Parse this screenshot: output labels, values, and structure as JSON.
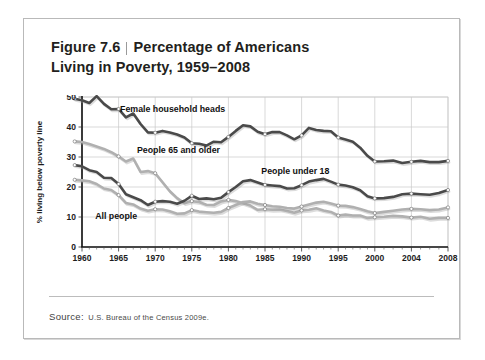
{
  "figure": {
    "number_label": "Figure 7.6",
    "title_line1": "Percentage of Americans",
    "title_line2": "Living in Poverty, 1959–2008"
  },
  "source": {
    "label": "Source:",
    "text": "U.S. Bureau of the Census 2009e."
  },
  "colors": {
    "dark_series": "#4a4a4a",
    "light_series": "#b0b0b0",
    "grid": "#c9c9c9",
    "axis": "#111111",
    "card_border": "#b9b9b9",
    "background": "#ffffff"
  },
  "chart_data": {
    "type": "line",
    "title": "Percentage of Americans Living in Poverty, 1959–2008",
    "xlabel": "",
    "ylabel": "% living below poverty line",
    "xlim": [
      1959,
      2008
    ],
    "ylim": [
      0,
      50
    ],
    "yticks": [
      0,
      10,
      20,
      30,
      40,
      50
    ],
    "xticks": [
      1960,
      1965,
      1970,
      1975,
      1980,
      1985,
      1990,
      1995,
      2000,
      2004,
      2008
    ],
    "grid": true,
    "legend": "inline-labels",
    "series": [
      {
        "name": "Female household heads",
        "color": "#4a4a4a",
        "label_x": 1965.2,
        "label_y": 45.0,
        "x": [
          1959,
          1960,
          1961,
          1962,
          1963,
          1964,
          1965,
          1966,
          1967,
          1968,
          1969,
          1970,
          1971,
          1972,
          1973,
          1974,
          1975,
          1976,
          1977,
          1978,
          1979,
          1980,
          1981,
          1982,
          1983,
          1984,
          1985,
          1986,
          1987,
          1988,
          1989,
          1990,
          1991,
          1992,
          1993,
          1994,
          1995,
          1996,
          1997,
          1998,
          1999,
          2000,
          2001,
          2002,
          2003,
          2004,
          2005,
          2006,
          2007,
          2008
        ],
        "y": [
          49.4,
          48.9,
          48.0,
          50.3,
          47.7,
          45.9,
          46.0,
          43.2,
          44.5,
          41.0,
          38.2,
          38.1,
          38.7,
          38.2,
          37.5,
          36.5,
          34.6,
          34.4,
          33.8,
          35.1,
          34.9,
          36.7,
          38.7,
          40.6,
          40.2,
          38.4,
          37.6,
          38.3,
          38.3,
          37.2,
          35.9,
          37.2,
          39.7,
          39.0,
          38.7,
          38.6,
          36.5,
          35.8,
          35.1,
          33.1,
          30.4,
          28.5,
          28.6,
          28.8,
          28.0,
          28.4,
          28.7,
          28.3,
          28.3,
          28.7
        ]
      },
      {
        "name": "People 65 and older",
        "color": "#b0b0b0",
        "label_x": 1967.5,
        "label_y": 31.3,
        "x": [
          1959,
          1960,
          1961,
          1962,
          1963,
          1964,
          1965,
          1966,
          1967,
          1968,
          1969,
          1970,
          1971,
          1972,
          1973,
          1974,
          1975,
          1976,
          1977,
          1978,
          1979,
          1980,
          1981,
          1982,
          1983,
          1984,
          1985,
          1986,
          1987,
          1988,
          1989,
          1990,
          1991,
          1992,
          1993,
          1994,
          1995,
          1996,
          1997,
          1998,
          1999,
          2000,
          2001,
          2002,
          2003,
          2004,
          2005,
          2006,
          2007,
          2008
        ],
        "y": [
          35.2,
          35.0,
          34.3,
          33.5,
          32.7,
          31.6,
          30.2,
          28.5,
          29.5,
          25.0,
          25.3,
          24.6,
          21.6,
          18.6,
          16.3,
          14.6,
          15.3,
          15.0,
          14.1,
          14.0,
          15.2,
          15.7,
          15.3,
          14.6,
          13.8,
          12.4,
          12.6,
          12.4,
          12.5,
          12.0,
          11.4,
          12.2,
          12.4,
          12.9,
          12.2,
          11.7,
          10.5,
          10.8,
          10.5,
          10.5,
          9.7,
          9.9,
          10.1,
          10.4,
          10.2,
          9.8,
          10.1,
          9.4,
          9.7,
          9.7
        ]
      },
      {
        "name": "People under 18",
        "color": "#4a4a4a",
        "label_x": 1984.5,
        "label_y": 24.3,
        "x": [
          1959,
          1960,
          1961,
          1962,
          1963,
          1964,
          1965,
          1966,
          1967,
          1968,
          1969,
          1970,
          1971,
          1972,
          1973,
          1974,
          1975,
          1976,
          1977,
          1978,
          1979,
          1980,
          1981,
          1982,
          1983,
          1984,
          1985,
          1986,
          1987,
          1988,
          1989,
          1990,
          1991,
          1992,
          1993,
          1994,
          1995,
          1996,
          1997,
          1998,
          1999,
          2000,
          2001,
          2002,
          2003,
          2004,
          2005,
          2006,
          2007,
          2008
        ],
        "y": [
          27.3,
          26.9,
          25.6,
          25.0,
          23.1,
          23.0,
          21.0,
          17.6,
          16.6,
          15.6,
          14.0,
          15.1,
          15.3,
          15.1,
          14.4,
          15.4,
          17.1,
          16.0,
          16.2,
          15.9,
          16.4,
          18.3,
          20.0,
          21.9,
          22.3,
          21.5,
          20.7,
          20.5,
          20.3,
          19.5,
          19.6,
          20.6,
          21.8,
          22.3,
          22.7,
          21.8,
          20.8,
          20.5,
          19.9,
          18.9,
          16.9,
          16.2,
          16.3,
          16.7,
          17.6,
          17.8,
          17.6,
          17.4,
          18.0,
          19.0
        ]
      },
      {
        "name": "All people",
        "color": "#b0b0b0",
        "label_x": 1961.8,
        "label_y": 9.2,
        "x": [
          1959,
          1960,
          1961,
          1962,
          1963,
          1964,
          1965,
          1966,
          1967,
          1968,
          1969,
          1970,
          1971,
          1972,
          1973,
          1974,
          1975,
          1976,
          1977,
          1978,
          1979,
          1980,
          1981,
          1982,
          1983,
          1984,
          1985,
          1986,
          1987,
          1988,
          1989,
          1990,
          1991,
          1992,
          1993,
          1994,
          1995,
          1996,
          1997,
          1998,
          1999,
          2000,
          2001,
          2002,
          2003,
          2004,
          2005,
          2006,
          2007,
          2008
        ],
        "y": [
          22.4,
          22.2,
          21.9,
          21.0,
          19.5,
          19.0,
          17.3,
          14.7,
          14.2,
          12.8,
          12.1,
          12.6,
          12.5,
          11.9,
          11.1,
          11.2,
          12.3,
          11.8,
          11.6,
          11.4,
          11.7,
          13.0,
          14.0,
          15.0,
          15.2,
          14.4,
          14.0,
          13.6,
          13.4,
          13.0,
          12.8,
          13.5,
          14.2,
          14.8,
          15.1,
          14.5,
          13.8,
          13.7,
          13.3,
          12.7,
          11.9,
          11.3,
          11.7,
          12.1,
          12.5,
          12.7,
          12.6,
          12.3,
          12.5,
          13.2
        ]
      }
    ],
    "marker_years": [
      1959,
      1965,
      1970,
      1975,
      1980,
      1985,
      1990,
      1995,
      2000,
      2004,
      2008
    ]
  }
}
